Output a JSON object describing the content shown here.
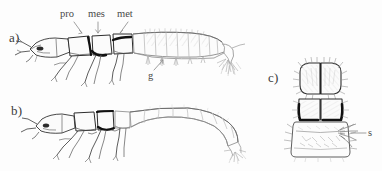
{
  "figure": {
    "caption_present": false,
    "background_color": "#fdfdfd",
    "ink_color": "#2b2b2b",
    "light_ink_color": "#b9b9b9",
    "dark_band_color": "#111111",
    "label_color": "#4a4a4a",
    "panels": [
      {
        "id": "a",
        "label": "a)",
        "label_x": 9,
        "label_y": 30,
        "view": "lateral",
        "description": "lateral view of larva with three thoracic segments and abdominal gills"
      },
      {
        "id": "b",
        "label": "b)",
        "label_x": 11,
        "label_y": 103,
        "view": "lateral",
        "description": "lateral view of second larva with smooth abdomen curving upward"
      },
      {
        "id": "c",
        "label": "c)",
        "label_x": 268,
        "label_y": 70,
        "view": "dorsal",
        "description": "dorsal view of head and thorax with setae"
      }
    ],
    "annotations": [
      {
        "id": "pro",
        "text": "pro",
        "panel": "a",
        "text_x": 60,
        "text_y": 10,
        "leader_x1": 74,
        "leader_y1": 22,
        "leader_x2": 82,
        "leader_y2": 33,
        "meaning": "prothorax"
      },
      {
        "id": "mes",
        "text": "mes",
        "panel": "a",
        "text_x": 88,
        "text_y": 10,
        "leader_x1": 98,
        "leader_y1": 22,
        "leader_x2": 98,
        "leader_y2": 33,
        "meaning": "mesothorax"
      },
      {
        "id": "met",
        "text": "met",
        "panel": "a",
        "text_x": 117,
        "text_y": 10,
        "leader_x1": 128,
        "leader_y1": 22,
        "leader_x2": 120,
        "leader_y2": 33,
        "meaning": "metathorax"
      },
      {
        "id": "g",
        "text": "g",
        "panel": "a",
        "text_x": 148,
        "text_y": 72,
        "leader_x1": 154,
        "leader_y1": 70,
        "leader_x2": 163,
        "leader_y2": 60,
        "meaning": "gill"
      },
      {
        "id": "s",
        "text": "s",
        "panel": "c",
        "text_x": 368,
        "text_y": 129,
        "leader_x1": 366,
        "leader_y1": 133,
        "leader_x2": 351,
        "leader_y2": 133,
        "meaning": "seta"
      }
    ]
  }
}
